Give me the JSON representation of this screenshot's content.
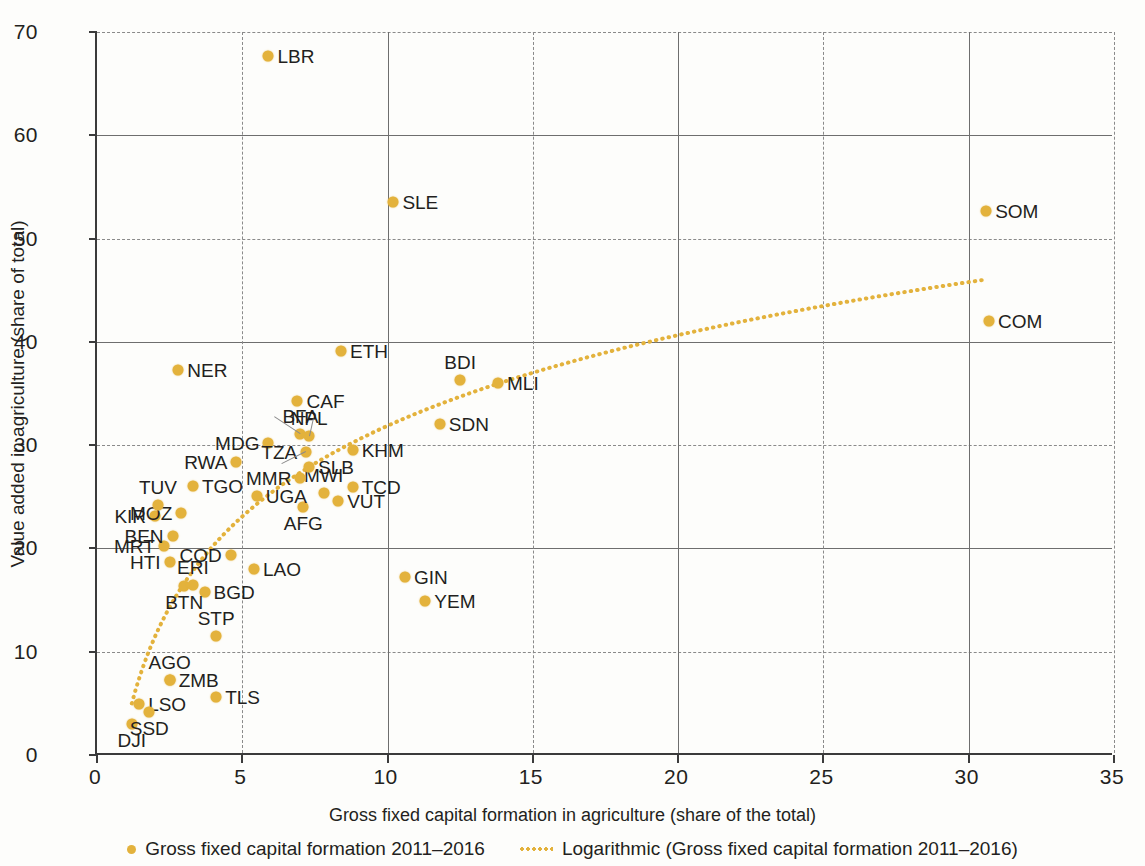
{
  "chart_data": {
    "type": "scatter",
    "title": "",
    "xlabel": "Gross fixed capital formation in agriculture (share of the total)",
    "ylabel": "Value added in agriculture (share of total)",
    "xlim": [
      0,
      35
    ],
    "ylim": [
      0,
      70
    ],
    "xticks": [
      0,
      5,
      10,
      15,
      20,
      25,
      30,
      35
    ],
    "yticks": [
      0,
      10,
      20,
      30,
      40,
      50,
      60,
      70
    ],
    "grid": true,
    "legend_position": "bottom",
    "series": [
      {
        "name": "Gross fixed capital formation 2011–2016",
        "marker": "circle",
        "color": "#e3b23c",
        "points": [
          {
            "label": "DJI",
            "x": 1.2,
            "y": 3.0,
            "pos": "b"
          },
          {
            "label": "LSO",
            "x": 1.45,
            "y": 4.9,
            "pos": "r"
          },
          {
            "label": "SSD",
            "x": 1.8,
            "y": 4.2,
            "pos": "b"
          },
          {
            "label": "ZMB",
            "x": 2.5,
            "y": 7.3,
            "pos": "r"
          },
          {
            "label": "AGO",
            "x": 2.5,
            "y": 7.3,
            "pos": "t"
          },
          {
            "label": "TLS",
            "x": 4.1,
            "y": 5.6,
            "pos": "r"
          },
          {
            "label": "STP",
            "x": 4.1,
            "y": 11.5,
            "pos": "t"
          },
          {
            "label": "BGD",
            "x": 3.7,
            "y": 15.8,
            "pos": "r"
          },
          {
            "label": "BTN",
            "x": 3.0,
            "y": 16.4,
            "pos": "b"
          },
          {
            "label": "ERI",
            "x": 3.3,
            "y": 16.5,
            "pos": "t"
          },
          {
            "label": "GIN",
            "x": 10.6,
            "y": 17.2,
            "pos": "r"
          },
          {
            "label": "YEM",
            "x": 11.3,
            "y": 14.9,
            "pos": "r"
          },
          {
            "label": "HTI",
            "x": 2.5,
            "y": 18.7,
            "pos": "l"
          },
          {
            "label": "LAO",
            "x": 5.4,
            "y": 18.0,
            "pos": "r"
          },
          {
            "label": "COD",
            "x": 4.6,
            "y": 19.4,
            "pos": "l"
          },
          {
            "label": "MRT",
            "x": 2.3,
            "y": 20.2,
            "pos": "l"
          },
          {
            "label": "BEN",
            "x": 2.6,
            "y": 21.2,
            "pos": "l"
          },
          {
            "label": "KIR",
            "x": 2.0,
            "y": 23.1,
            "pos": "l"
          },
          {
            "label": "MOZ",
            "x": 2.9,
            "y": 23.4,
            "pos": "l"
          },
          {
            "label": "TUV",
            "x": 2.1,
            "y": 24.2,
            "pos": "t"
          },
          {
            "label": "AFG",
            "x": 7.1,
            "y": 24.0,
            "pos": "b"
          },
          {
            "label": "VUT",
            "x": 8.3,
            "y": 24.6,
            "pos": "r"
          },
          {
            "label": "UGA",
            "x": 5.5,
            "y": 25.1,
            "pos": "r"
          },
          {
            "label": "TGO",
            "x": 3.3,
            "y": 26.0,
            "pos": "r"
          },
          {
            "label": "MWI",
            "x": 7.8,
            "y": 25.4,
            "pos": "t"
          },
          {
            "label": "TCD",
            "x": 8.8,
            "y": 25.9,
            "pos": "r"
          },
          {
            "label": "MMR",
            "x": 7.0,
            "y": 26.8,
            "pos": "l"
          },
          {
            "label": "RWA",
            "x": 4.8,
            "y": 28.4,
            "pos": "l"
          },
          {
            "label": "SLB",
            "x": 7.3,
            "y": 27.9,
            "pos": "r"
          },
          {
            "label": "KHM",
            "x": 8.8,
            "y": 29.5,
            "pos": "r"
          },
          {
            "label": "MDG",
            "x": 5.9,
            "y": 30.2,
            "pos": "l"
          },
          {
            "label": "TZA",
            "x": 7.2,
            "y": 29.3,
            "pos": "l"
          },
          {
            "label": "BFA",
            "x": 7.0,
            "y": 31.1,
            "pos": "t"
          },
          {
            "label": "NPL",
            "x": 7.3,
            "y": 30.9,
            "pos": "t"
          },
          {
            "label": "SDN",
            "x": 11.8,
            "y": 32.0,
            "pos": "r"
          },
          {
            "label": "CAF",
            "x": 6.9,
            "y": 34.3,
            "pos": "r"
          },
          {
            "label": "MLI",
            "x": 13.8,
            "y": 36.0,
            "pos": "r"
          },
          {
            "label": "BDI",
            "x": 12.5,
            "y": 36.3,
            "pos": "t"
          },
          {
            "label": "NER",
            "x": 2.8,
            "y": 37.3,
            "pos": "r"
          },
          {
            "label": "ETH",
            "x": 8.4,
            "y": 39.1,
            "pos": "r"
          },
          {
            "label": "COM",
            "x": 30.7,
            "y": 42.0,
            "pos": "r"
          },
          {
            "label": "SOM",
            "x": 30.6,
            "y": 52.7,
            "pos": "r"
          },
          {
            "label": "SLE",
            "x": 10.2,
            "y": 53.5,
            "pos": "r"
          },
          {
            "label": "LBR",
            "x": 5.9,
            "y": 67.7,
            "pos": "r"
          }
        ]
      }
    ],
    "trendline": {
      "name": "Logarithmic (Gross fixed capital formation 2011–2016)",
      "type": "logarithmic",
      "style": "dotted",
      "color": "#e3b23c",
      "equation_a": 12.7,
      "equation_b": 2.5,
      "x_start": 1.2,
      "x_end": 30.6
    }
  },
  "legend": {
    "items": [
      {
        "marker": "scatter-dot",
        "label": "Gross fixed capital formation 2011–2016"
      },
      {
        "marker": "dotted-line",
        "label": "Logarithmic (Gross fixed capital formation 2011–2016)"
      }
    ]
  },
  "colors": {
    "marker": "#e3b23c",
    "trend": "#e3b23c",
    "axis": "#3b3b3b",
    "grid": "#8a8a8a",
    "text": "#231f20",
    "background": "#fdfdfb"
  }
}
